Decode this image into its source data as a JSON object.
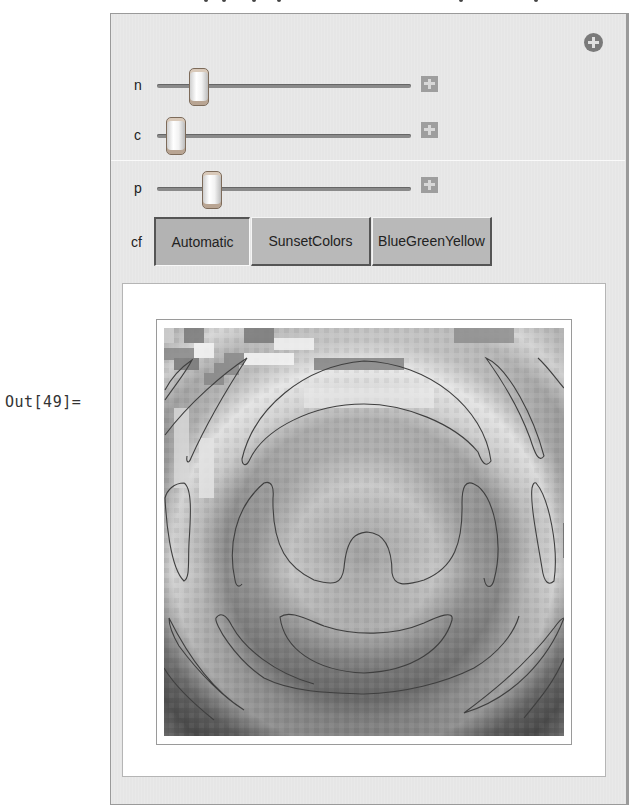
{
  "notebook": {
    "output_label": "Out[49]="
  },
  "manipulate": {
    "add_button_icon": "plus-circle-icon",
    "controls": [
      {
        "name": "n",
        "label": "n",
        "position_pct": 15,
        "plus_icon": "plus-icon"
      },
      {
        "name": "c",
        "label": "c",
        "position_pct": 4,
        "plus_icon": "plus-icon"
      },
      {
        "name": "p",
        "label": "p",
        "position_pct": 21,
        "plus_icon": "plus-icon"
      }
    ],
    "colorfunction": {
      "label": "cf",
      "options": [
        "Automatic",
        "SunsetColors",
        "BlueGreenYellow"
      ],
      "selected": "Automatic"
    }
  },
  "plot": {
    "type": "density-contour-plot",
    "colors": {
      "frame": "#9a9a9a",
      "contour": "#4a4a4a"
    }
  }
}
